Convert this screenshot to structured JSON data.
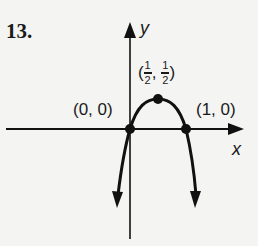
{
  "problem": {
    "number": "13."
  },
  "axes": {
    "x_label": "x",
    "y_label": "y"
  },
  "points": [
    {
      "label": "(0, 0)",
      "x": 0,
      "y": 0
    },
    {
      "label_open": "(",
      "num1": "1",
      "den1": "2",
      "sep": ",",
      "num2": "1",
      "den2": "2",
      "label_close": ")",
      "x": 0.5,
      "y": 0.5
    },
    {
      "label": "(1, 0)",
      "x": 1,
      "y": 0
    }
  ],
  "curve": {
    "description": "downward-opening parabola through (0,0), vertex (1/2,1/2), (1,0)",
    "color": "#111111"
  }
}
